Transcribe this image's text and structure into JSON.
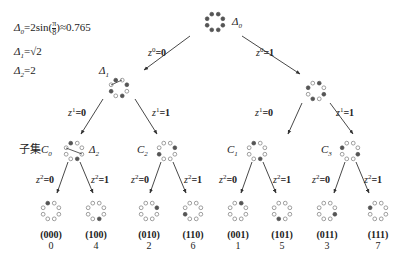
{
  "legend": {
    "delta0": {
      "symbol": "Δ",
      "sub": "0",
      "formula": "=2sin(",
      "frac_num": "π",
      "frac_den": "8",
      "tail": ")≈0.765"
    },
    "delta1": {
      "symbol": "Δ",
      "sub": "1",
      "formula": "=√2"
    },
    "delta2": {
      "symbol": "Δ",
      "sub": "2",
      "formula": "=2"
    }
  },
  "nodes": {
    "root": {
      "label": "Δ",
      "label_sub": "0",
      "filled": [
        0,
        1,
        2,
        3,
        4,
        5,
        6,
        7
      ]
    },
    "level1_left": {
      "label": "Δ",
      "label_sub": "1",
      "filled": [
        0,
        2,
        4,
        6
      ]
    },
    "level1_right": {
      "label": "",
      "filled": [
        1,
        3,
        5,
        7
      ]
    },
    "level2": [
      {
        "id": "C0",
        "label_prefix": "子集",
        "label": "C",
        "label_sub": "0",
        "extra_label": "Δ",
        "extra_sub": "2",
        "filled": [
          6,
          2
        ]
      },
      {
        "id": "C2",
        "label": "C",
        "label_sub": "2",
        "filled": [
          0,
          4
        ]
      },
      {
        "id": "C1",
        "label": "C",
        "label_sub": "1",
        "filled": [
          2,
          6
        ]
      },
      {
        "id": "C3",
        "label": "C",
        "label_sub": "3",
        "filled": [
          7,
          3
        ]
      }
    ],
    "leaves": [
      {
        "code": "(000)",
        "index": "0",
        "filled": 2
      },
      {
        "code": "(100)",
        "index": "4",
        "filled": 6
      },
      {
        "code": "(010)",
        "index": "2",
        "filled": 0
      },
      {
        "code": "(110)",
        "index": "6",
        "filled": 4
      },
      {
        "code": "(001)",
        "index": "1",
        "filled": 1
      },
      {
        "code": "(101)",
        "index": "5",
        "filled": 5
      },
      {
        "code": "(011)",
        "index": "3",
        "filled": 7
      },
      {
        "code": "(111)",
        "index": "7",
        "filled": 3
      }
    ]
  },
  "edges": {
    "level0": [
      {
        "var": "z",
        "sup": "0",
        "sub": "n",
        "value": "=0"
      },
      {
        "var": "z",
        "sup": "0",
        "sub": "n",
        "value": "=1"
      }
    ],
    "level1": [
      {
        "var": "z",
        "sup": "1",
        "sub": "n",
        "value": "=0"
      },
      {
        "var": "z",
        "sup": "1",
        "sub": "n",
        "value": "=1"
      },
      {
        "var": "z",
        "sup": "1",
        "sub": "n",
        "value": "=0"
      },
      {
        "var": "z",
        "sup": "1",
        "sub": "n",
        "value": "=1"
      }
    ],
    "level2": [
      {
        "var": "z",
        "sup": "2",
        "sub": "n",
        "value": "=0"
      },
      {
        "var": "z",
        "sup": "2",
        "sub": "n",
        "value": "=1"
      },
      {
        "var": "z",
        "sup": "2",
        "sub": "n",
        "value": "=0"
      },
      {
        "var": "z",
        "sup": "2",
        "sub": "n",
        "value": "=1"
      },
      {
        "var": "z",
        "sup": "2",
        "sub": "n",
        "value": "=0"
      },
      {
        "var": "z",
        "sup": "2",
        "sub": "n",
        "value": "=1"
      },
      {
        "var": "z",
        "sup": "2",
        "sub": "n",
        "value": "=0"
      },
      {
        "var": "z",
        "sup": "2",
        "sub": "n",
        "value": "=1"
      }
    ]
  },
  "colors": {
    "filled": "#555555",
    "hollow_stroke": "#777777",
    "line": "#333333",
    "text": "#222222"
  }
}
